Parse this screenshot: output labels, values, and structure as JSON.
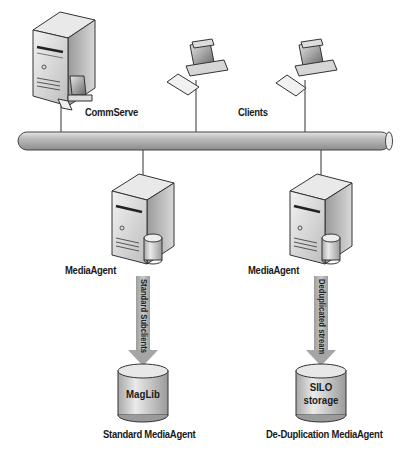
{
  "diagram": {
    "network": {
      "label": "network-bus"
    },
    "commserve": {
      "label": "CommServe"
    },
    "clients": {
      "label": "Clients"
    },
    "media_agents": [
      {
        "label": "MediaAgent",
        "stream_label": "Standard Subclients",
        "storage_label_line1": "MagLib",
        "storage_label_line2": "",
        "caption": "Standard MediaAgent"
      },
      {
        "label": "MediaAgent",
        "stream_label": "Deduplicated stream",
        "storage_label_line1": "SILO",
        "storage_label_line2": "storage",
        "caption": "De-Duplication MediaAgent"
      }
    ]
  }
}
